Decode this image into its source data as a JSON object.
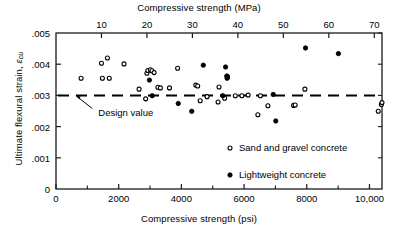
{
  "chart_data": {
    "type": "scatter",
    "title": "",
    "xlabel": "Compressive strength (psi)",
    "xlabel_top": "Compressive strength (MPa)",
    "ylabel": "Ultimate flexural strain, εcu",
    "ylabel_text": "Ultimate flexural strain, ",
    "ylabel_symbol": "ε",
    "ylabel_subscript": "cu",
    "xlim": [
      0,
      10400
    ],
    "ylim": [
      0,
      0.005
    ],
    "xlim_top_mpa": [
      0,
      71.7
    ],
    "grid": false,
    "legend_position": "inside-lower-right",
    "xticks": [
      0,
      2000,
      4000,
      6000,
      8000,
      10000
    ],
    "xtick_labels": [
      "0",
      "2000",
      "4000",
      "6000",
      "8000",
      "10,000"
    ],
    "xminor_ticks": [
      1000,
      3000,
      5000,
      7000,
      9000
    ],
    "xticks_top_mpa": [
      10,
      20,
      30,
      40,
      50,
      60,
      70
    ],
    "xtick_labels_top": [
      "10",
      "20",
      "30",
      "40",
      "50",
      "60",
      "70"
    ],
    "yticks": [
      0,
      0.001,
      0.002,
      0.003,
      0.004,
      0.005
    ],
    "ytick_labels": [
      "0",
      ".001",
      ".002",
      ".003",
      ".004",
      ".005"
    ],
    "annotations": [
      {
        "text": "Design value",
        "x_psi": 1350,
        "y": 0.00245,
        "points_to_x_psi": 620,
        "points_to_y": 0.003
      }
    ],
    "reference_line": {
      "label": "Design value",
      "y": 0.003,
      "style": "dashed",
      "color": "#000000"
    },
    "series": [
      {
        "name": "Sand and gravel concrete",
        "marker": "open-circle",
        "color": "#000000",
        "points": [
          [
            800,
            0.00355
          ],
          [
            1450,
            0.00403
          ],
          [
            1480,
            0.00355
          ],
          [
            1640,
            0.0042
          ],
          [
            1700,
            0.00355
          ],
          [
            2170,
            0.00401
          ],
          [
            2650,
            0.0032
          ],
          [
            2860,
            0.00289
          ],
          [
            2900,
            0.00371
          ],
          [
            2930,
            0.0038
          ],
          [
            3010,
            0.00382
          ],
          [
            3060,
            0.00379
          ],
          [
            3130,
            0.00373
          ],
          [
            3250,
            0.00326
          ],
          [
            3330,
            0.00324
          ],
          [
            3620,
            0.00324
          ],
          [
            3880,
            0.00387
          ],
          [
            4460,
            0.00333
          ],
          [
            4520,
            0.0033
          ],
          [
            4600,
            0.00283
          ],
          [
            4820,
            0.00296
          ],
          [
            5170,
            0.00279
          ],
          [
            5200,
            0.00327
          ],
          [
            5380,
            0.00291
          ],
          [
            5460,
            0.00361
          ],
          [
            5470,
            0.00358
          ],
          [
            5720,
            0.00299
          ],
          [
            5930,
            0.00299
          ],
          [
            6130,
            0.00301
          ],
          [
            6440,
            0.00238
          ],
          [
            6520,
            0.00299
          ],
          [
            6760,
            0.00267
          ],
          [
            7580,
            0.00268
          ],
          [
            7630,
            0.00269
          ],
          [
            7940,
            0.0032
          ],
          [
            10280,
            0.00249
          ],
          [
            10380,
            0.00271
          ],
          [
            10400,
            0.00277
          ]
        ]
      },
      {
        "name": "Lightweight concrete",
        "marker": "filled-circle",
        "color": "#000000",
        "points": [
          [
            2980,
            0.00349
          ],
          [
            3070,
            0.00299
          ],
          [
            3900,
            0.00274
          ],
          [
            4330,
            0.00249
          ],
          [
            4700,
            0.00397
          ],
          [
            5320,
            0.00299
          ],
          [
            5410,
            0.00391
          ],
          [
            5450,
            0.00362
          ],
          [
            5460,
            0.00355
          ],
          [
            6930,
            0.00303
          ],
          [
            7010,
            0.00218
          ],
          [
            7960,
            0.00452
          ],
          [
            9010,
            0.00434
          ]
        ]
      }
    ]
  },
  "legend": {
    "items": [
      {
        "label": "Sand and gravel concrete",
        "marker": "open-circle"
      },
      {
        "label": "Lightweight concrete",
        "marker": "filled-circle"
      }
    ]
  }
}
